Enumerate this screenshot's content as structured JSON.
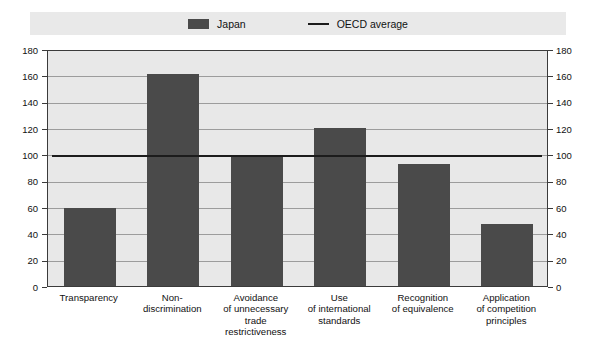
{
  "legend": {
    "entries": [
      {
        "label": "Japan",
        "marker": "bar-swatch-icon",
        "color": "#4a4a4a"
      },
      {
        "label": "OECD average",
        "marker": "line-swatch-icon",
        "color": "#1c1c1c"
      }
    ]
  },
  "axes": {
    "left_ticks": [
      "180",
      "160",
      "140",
      "120",
      "100",
      "80",
      "60",
      "40",
      "20",
      "0"
    ],
    "right_ticks": [
      "180",
      "160",
      "140",
      "120",
      "100",
      "80",
      "60",
      "40",
      "20",
      "0"
    ]
  },
  "categories_display": [
    [
      "Transparency"
    ],
    [
      "Non-",
      "discrimination"
    ],
    [
      "Avoidance",
      "of unnecessary",
      "trade",
      "restrictiveness"
    ],
    [
      "Use",
      "of international",
      "standards"
    ],
    [
      "Recognition",
      "of equivalence"
    ],
    [
      "Application",
      "of competition",
      "principles"
    ]
  ],
  "chart_data": {
    "type": "bar",
    "title": "",
    "xlabel": "",
    "ylabel": "",
    "ylim": [
      0,
      180
    ],
    "ytick_step": 20,
    "grid": true,
    "legend_position": "top-center",
    "dual_y_axis": true,
    "categories": [
      "Transparency",
      "Non-discrimination",
      "Avoidance of unnecessary trade restrictiveness",
      "Use of international standards",
      "Recognition of equivalence",
      "Application of competition principles"
    ],
    "series": [
      {
        "name": "Japan",
        "type": "bar",
        "color": "#4a4a4a",
        "values": [
          59,
          161,
          98,
          120,
          93,
          47
        ]
      },
      {
        "name": "OECD average",
        "type": "line",
        "color": "#1c1c1c",
        "constant_value": 100
      }
    ]
  }
}
